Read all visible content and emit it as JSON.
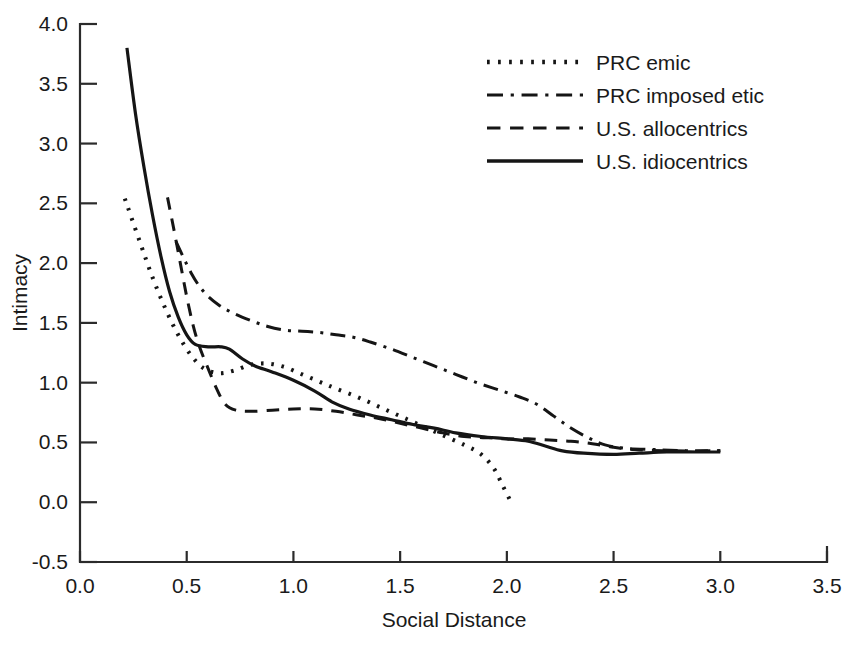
{
  "chart_data": {
    "type": "line",
    "title": "",
    "xlabel": "Social Distance",
    "ylabel": "Intimacy",
    "xlim": [
      0.0,
      3.5
    ],
    "ylim": [
      -0.5,
      4.0
    ],
    "xticks": [
      "0.0",
      "0.5",
      "1.0",
      "1.5",
      "2.0",
      "2.5",
      "3.0",
      "3.5"
    ],
    "xtick_values": [
      0.0,
      0.5,
      1.0,
      1.5,
      2.0,
      2.5,
      3.0,
      3.5
    ],
    "yticks": [
      "-0.5",
      "0.0",
      "0.5",
      "1.0",
      "1.5",
      "2.0",
      "2.5",
      "3.0",
      "3.5",
      "4.0"
    ],
    "ytick_values": [
      -0.5,
      0.0,
      0.5,
      1.0,
      1.5,
      2.0,
      2.5,
      3.0,
      3.5,
      4.0
    ],
    "grid": false,
    "legend_position": "top-center-right",
    "series": [
      {
        "name": "PRC emic",
        "style": "dotted",
        "color": "#151515",
        "points": [
          [
            0.21,
            2.54
          ],
          [
            0.28,
            2.18
          ],
          [
            0.34,
            1.88
          ],
          [
            0.4,
            1.62
          ],
          [
            0.46,
            1.4
          ],
          [
            0.52,
            1.23
          ],
          [
            0.58,
            1.12
          ],
          [
            0.65,
            1.08
          ],
          [
            0.72,
            1.1
          ],
          [
            0.8,
            1.15
          ],
          [
            0.88,
            1.16
          ],
          [
            0.96,
            1.13
          ],
          [
            1.04,
            1.07
          ],
          [
            1.12,
            1.01
          ],
          [
            1.2,
            0.95
          ],
          [
            1.3,
            0.88
          ],
          [
            1.4,
            0.8
          ],
          [
            1.5,
            0.72
          ],
          [
            1.6,
            0.64
          ],
          [
            1.7,
            0.56
          ],
          [
            1.8,
            0.48
          ],
          [
            1.88,
            0.4
          ],
          [
            1.94,
            0.28
          ],
          [
            1.98,
            0.14
          ],
          [
            2.02,
            0.0
          ]
        ]
      },
      {
        "name": "PRC imposed etic",
        "style": "dashdot",
        "color": "#151515",
        "points": [
          [
            0.45,
            2.18
          ],
          [
            0.52,
            1.92
          ],
          [
            0.58,
            1.76
          ],
          [
            0.65,
            1.65
          ],
          [
            0.72,
            1.58
          ],
          [
            0.8,
            1.52
          ],
          [
            0.88,
            1.47
          ],
          [
            0.96,
            1.44
          ],
          [
            1.04,
            1.43
          ],
          [
            1.12,
            1.42
          ],
          [
            1.2,
            1.4
          ],
          [
            1.28,
            1.38
          ],
          [
            1.36,
            1.34
          ],
          [
            1.46,
            1.28
          ],
          [
            1.56,
            1.21
          ],
          [
            1.66,
            1.14
          ],
          [
            1.76,
            1.07
          ],
          [
            1.86,
            1.0
          ],
          [
            1.96,
            0.94
          ],
          [
            2.06,
            0.88
          ],
          [
            2.14,
            0.82
          ],
          [
            2.22,
            0.72
          ],
          [
            2.3,
            0.62
          ],
          [
            2.38,
            0.54
          ],
          [
            2.46,
            0.48
          ],
          [
            2.56,
            0.45
          ],
          [
            2.7,
            0.44
          ],
          [
            2.85,
            0.43
          ],
          [
            3.0,
            0.43
          ]
        ]
      },
      {
        "name": "U.S. allocentrics",
        "style": "dashed",
        "color": "#151515",
        "points": [
          [
            0.41,
            2.55
          ],
          [
            0.44,
            2.28
          ],
          [
            0.47,
            2.0
          ],
          [
            0.5,
            1.72
          ],
          [
            0.53,
            1.48
          ],
          [
            0.56,
            1.3
          ],
          [
            0.6,
            1.12
          ],
          [
            0.64,
            0.95
          ],
          [
            0.68,
            0.82
          ],
          [
            0.73,
            0.77
          ],
          [
            0.8,
            0.76
          ],
          [
            0.9,
            0.77
          ],
          [
            1.0,
            0.78
          ],
          [
            1.1,
            0.78
          ],
          [
            1.2,
            0.76
          ],
          [
            1.3,
            0.73
          ],
          [
            1.4,
            0.7
          ],
          [
            1.5,
            0.66
          ],
          [
            1.6,
            0.62
          ],
          [
            1.7,
            0.58
          ],
          [
            1.8,
            0.55
          ],
          [
            1.9,
            0.54
          ],
          [
            2.0,
            0.53
          ],
          [
            2.1,
            0.53
          ],
          [
            2.2,
            0.52
          ],
          [
            2.3,
            0.51
          ],
          [
            2.4,
            0.49
          ],
          [
            2.5,
            0.46
          ],
          [
            2.6,
            0.44
          ],
          [
            2.75,
            0.43
          ],
          [
            3.0,
            0.43
          ]
        ]
      },
      {
        "name": "U.S. idiocentrics",
        "style": "solid",
        "color": "#151515",
        "points": [
          [
            0.22,
            3.8
          ],
          [
            0.26,
            3.25
          ],
          [
            0.3,
            2.8
          ],
          [
            0.34,
            2.4
          ],
          [
            0.38,
            2.05
          ],
          [
            0.42,
            1.76
          ],
          [
            0.46,
            1.55
          ],
          [
            0.5,
            1.4
          ],
          [
            0.54,
            1.32
          ],
          [
            0.6,
            1.3
          ],
          [
            0.66,
            1.3
          ],
          [
            0.7,
            1.28
          ],
          [
            0.76,
            1.2
          ],
          [
            0.82,
            1.14
          ],
          [
            0.9,
            1.09
          ],
          [
            1.0,
            1.02
          ],
          [
            1.1,
            0.93
          ],
          [
            1.18,
            0.84
          ],
          [
            1.26,
            0.78
          ],
          [
            1.36,
            0.73
          ],
          [
            1.46,
            0.69
          ],
          [
            1.56,
            0.65
          ],
          [
            1.66,
            0.62
          ],
          [
            1.76,
            0.58
          ],
          [
            1.88,
            0.55
          ],
          [
            2.0,
            0.53
          ],
          [
            2.1,
            0.51
          ],
          [
            2.18,
            0.47
          ],
          [
            2.26,
            0.43
          ],
          [
            2.36,
            0.41
          ],
          [
            2.5,
            0.4
          ],
          [
            2.62,
            0.41
          ],
          [
            2.75,
            0.42
          ],
          [
            2.9,
            0.42
          ],
          [
            3.0,
            0.42
          ]
        ]
      }
    ]
  },
  "legend": {
    "entries": [
      {
        "label": "PRC emic",
        "style": "dotted"
      },
      {
        "label": "PRC imposed etic",
        "style": "dashdot"
      },
      {
        "label": "U.S. allocentrics",
        "style": "dashed"
      },
      {
        "label": "U.S. idiocentrics",
        "style": "solid"
      }
    ]
  },
  "axes": {
    "x_title": "Social Distance",
    "y_title": "Intimacy"
  }
}
